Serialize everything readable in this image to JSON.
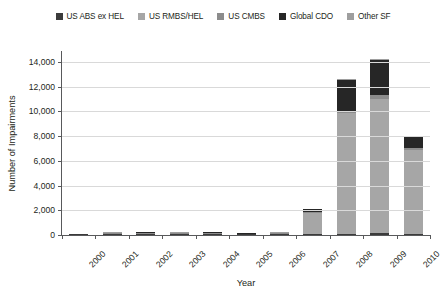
{
  "chart_data": {
    "type": "bar",
    "stacked": true,
    "title": "",
    "xlabel": "Year",
    "ylabel": "Number of Impairments",
    "categories": [
      "2000",
      "2001",
      "2002",
      "2003",
      "2004",
      "2005",
      "2006",
      "2007",
      "2008",
      "2009",
      "2010"
    ],
    "ylim": [
      0,
      14800
    ],
    "yticks": [
      0,
      2000,
      4000,
      6000,
      8000,
      10000,
      12000,
      14000
    ],
    "ytick_labels": [
      "0",
      "2,000",
      "4,000",
      "6,000",
      "8,000",
      "10,000",
      "12,000",
      "14,000"
    ],
    "grid": true,
    "legend_position": "top",
    "series": [
      {
        "name": "US ABS ex HEL",
        "color": "#3b3b3b",
        "values": [
          10,
          40,
          60,
          40,
          55,
          10,
          20,
          60,
          120,
          140,
          90
        ]
      },
      {
        "name": "US RMBS/HEL",
        "color": "#a6a6a6",
        "values": [
          5,
          20,
          40,
          30,
          35,
          10,
          25,
          1750,
          9750,
          10850,
          6750
        ]
      },
      {
        "name": "US CMBS",
        "color": "#8c8c8c",
        "values": [
          0,
          5,
          10,
          5,
          10,
          0,
          5,
          30,
          120,
          350,
          160
        ]
      },
      {
        "name": "Global CDO",
        "color": "#262626",
        "values": [
          0,
          10,
          60,
          45,
          55,
          5,
          30,
          230,
          2550,
          2800,
          950
        ]
      },
      {
        "name": "Other SF",
        "color": "#9e9e9e",
        "values": [
          0,
          5,
          10,
          10,
          10,
          0,
          5,
          30,
          60,
          60,
          50
        ]
      }
    ],
    "totals": [
      15,
      80,
      180,
      130,
      165,
      25,
      85,
      2100,
      12600,
      14200,
      8000
    ]
  }
}
